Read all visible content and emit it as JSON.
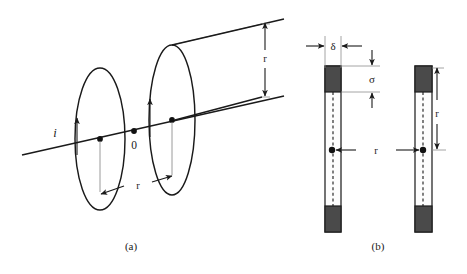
{
  "figure": {
    "background_color": "#ffffff",
    "ink_color": "#1a1a1a",
    "width": 467,
    "height": 274
  },
  "panel_a": {
    "caption": "(a)",
    "current_label": "i",
    "origin_label": "0",
    "coil_radius_label": "r",
    "separation_label": "r",
    "description": "Two coaxial circular coils carrying current i, separated along their common axis",
    "coils": [
      {
        "name": "left-coil",
        "cx": 100,
        "cy": 139,
        "rx": 25,
        "ry": 71,
        "current_arrow": "up"
      },
      {
        "name": "right-coil",
        "cx": 172,
        "cy": 120,
        "rx": 23,
        "ry": 75,
        "current_arrow": "up"
      }
    ],
    "axis_points": [
      {
        "name": "left-coil-center",
        "x": 100,
        "y": 139
      },
      {
        "name": "origin",
        "x": 134,
        "y": 131
      },
      {
        "name": "right-coil-center",
        "x": 172,
        "y": 120
      }
    ]
  },
  "panel_b": {
    "caption": "(b)",
    "thickness_label": "δ",
    "gap_label": "σ",
    "height_label": "r",
    "separation_label": "r",
    "description": "Two parallel flat strip conductors of thickness delta separated by distance r",
    "bars": [
      {
        "name": "left-bar",
        "x": 325,
        "top": 66,
        "width": 16,
        "height": 166
      },
      {
        "name": "right-bar",
        "x": 415,
        "top": 66,
        "width": 17,
        "height": 166
      }
    ],
    "midpoints": [
      {
        "name": "left-bar-midpoint",
        "x": 332,
        "y": 150
      },
      {
        "name": "right-bar-midpoint",
        "x": 423,
        "y": 150
      }
    ]
  }
}
